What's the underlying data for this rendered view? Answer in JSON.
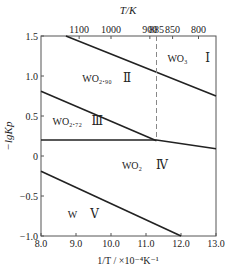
{
  "chart_data": {
    "type": "line",
    "title": "",
    "xlabel": "1/T / ×10⁻⁴K⁻¹",
    "ylabel": "−lgKp",
    "top_axis_label": "T/K",
    "xlim": [
      8.0,
      13.0
    ],
    "ylim": [
      -1.0,
      1.5
    ],
    "x_ticks": [
      8.0,
      9.0,
      10.0,
      11.0,
      12.0,
      13.0
    ],
    "x_tick_labels": [
      "8.0",
      "9.0",
      "10.0",
      "11.0",
      "12.0",
      "13.0"
    ],
    "y_ticks": [
      1.5,
      1.0,
      0.5,
      0,
      -0.5,
      -1.0
    ],
    "y_tick_labels": [
      "1.5",
      "1.0",
      "0.5",
      "0",
      "−0.5",
      "−1.0"
    ],
    "top_ticks": [
      {
        "label": "1100",
        "x": 9.09
      },
      {
        "label": "1000",
        "x": 10.0
      },
      {
        "label": "900",
        "x": 11.11
      },
      {
        "label": "885",
        "x": 11.3
      },
      {
        "label": "850",
        "x": 11.76
      },
      {
        "label": "800",
        "x": 12.5
      }
    ],
    "grid": false,
    "series": [
      {
        "name": "WO3/WO2.90 boundary",
        "style": "solid",
        "points": [
          [
            8.71,
            1.5
          ],
          [
            13.0,
            0.75
          ]
        ]
      },
      {
        "name": "WO2.90/WO2.72 boundary",
        "style": "solid",
        "points": [
          [
            8.0,
            0.81
          ],
          [
            11.3,
            0.19
          ]
        ]
      },
      {
        "name": "WO2.72/WO2 boundary",
        "style": "solid",
        "points": [
          [
            8.0,
            0.2
          ],
          [
            11.3,
            0.2
          ],
          [
            13.0,
            0.09
          ]
        ]
      },
      {
        "name": "WO2/W boundary",
        "style": "solid",
        "points": [
          [
            8.0,
            -0.19
          ],
          [
            12.0,
            -1.0
          ]
        ]
      },
      {
        "name": "885 K divider",
        "style": "dashed",
        "points": [
          [
            11.3,
            1.5
          ],
          [
            11.3,
            0.2
          ]
        ]
      }
    ],
    "annotations": [
      {
        "text": "WO₃",
        "numeral": "Ⅰ",
        "x": 11.9,
        "y": 1.17
      },
      {
        "text": "WO₂.₉₀",
        "numeral": "Ⅱ",
        "x": 9.6,
        "y": 0.92
      },
      {
        "text": "WO₂.₇₂",
        "numeral": "Ⅲ",
        "x": 8.75,
        "y": 0.39
      },
      {
        "text": "WO₂",
        "numeral": "Ⅳ",
        "x": 10.6,
        "y": -0.16
      },
      {
        "text": "W",
        "numeral": "Ⅴ",
        "x": 8.9,
        "y": -0.78
      }
    ]
  }
}
